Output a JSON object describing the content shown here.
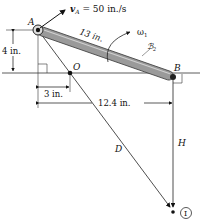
{
  "diagram": {
    "points": {
      "A": {
        "label": "A"
      },
      "B": {
        "label": "B"
      },
      "O": {
        "label": "O"
      },
      "I": {
        "label": "I"
      }
    },
    "velocity": {
      "label": "v",
      "subscript": "A",
      "value_text": " = 50 in./s"
    },
    "link": {
      "length_label": "13 in.",
      "omega_label": "ω",
      "omega_sub": "1",
      "body_label": "ℬ",
      "body_sub": "2"
    },
    "dimensions": {
      "vertical_A": "4 in.",
      "horizontal_O": "3 in.",
      "horizontal_B": "12.4 in."
    },
    "lines": {
      "D_label": "D",
      "H_label": "H"
    },
    "colors": {
      "ink": "#111111",
      "link_fill": "#9a9a9a",
      "link_edge": "#444444"
    }
  }
}
